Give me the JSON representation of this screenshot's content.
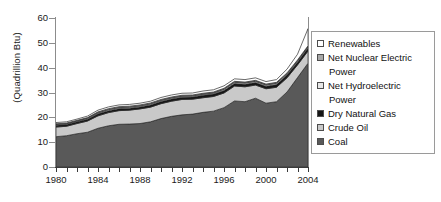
{
  "chart_data": {
    "type": "area",
    "stacked": true,
    "title": "",
    "xlabel": "",
    "ylabel": "(Quadrillion Btu)",
    "ylim": [
      0,
      60
    ],
    "ytick_values": [
      0,
      10,
      20,
      30,
      40,
      50,
      60
    ],
    "ytick_labels": [
      "0",
      "10",
      "20",
      "30",
      "40",
      "50",
      "60"
    ],
    "xlim": [
      1980,
      2004
    ],
    "x": [
      1980,
      1981,
      1982,
      1983,
      1984,
      1985,
      1986,
      1987,
      1988,
      1989,
      1990,
      1991,
      1992,
      1993,
      1994,
      1995,
      1996,
      1997,
      1998,
      1999,
      2000,
      2001,
      2002,
      2003,
      2004
    ],
    "xtick_values": [
      1980,
      1981,
      1982,
      1983,
      1984,
      1985,
      1986,
      1987,
      1988,
      1989,
      1990,
      1991,
      1992,
      1993,
      1994,
      1995,
      1996,
      1997,
      1998,
      1999,
      2000,
      2001,
      2002,
      2003,
      2004
    ],
    "xtick_labels": [
      {
        "value": 1980,
        "label": "1980"
      },
      {
        "value": 1984,
        "label": "1984"
      },
      {
        "value": 1988,
        "label": "1988"
      },
      {
        "value": 1992,
        "label": "1992"
      },
      {
        "value": 1996,
        "label": "1996"
      },
      {
        "value": 2000,
        "label": "2000"
      },
      {
        "value": 2004,
        "label": "2004"
      }
    ],
    "grid": false,
    "legend_position": "right",
    "series": [
      {
        "name": "Coal",
        "color": "#595959",
        "values": [
          12.2,
          12.6,
          13.4,
          14.0,
          15.6,
          16.6,
          17.2,
          17.3,
          17.5,
          18.2,
          19.5,
          20.4,
          21.0,
          21.3,
          22.0,
          22.5,
          23.9,
          26.6,
          26.3,
          27.7,
          25.7,
          26.3,
          30.2,
          36.0,
          41.8
        ],
        "swatch": "dark-gray"
      },
      {
        "name": "Crude Oil",
        "color": "#c9c9c9",
        "values": [
          3.9,
          3.8,
          4.1,
          4.5,
          5.0,
          5.3,
          5.5,
          5.6,
          5.9,
          5.9,
          6.0,
          6.1,
          6.2,
          6.0,
          5.9,
          5.9,
          5.9,
          6.0,
          6.0,
          5.3,
          5.8,
          5.8,
          5.7,
          5.1,
          4.9
        ],
        "swatch": "light-gray"
      },
      {
        "name": "Dry Natural Gas",
        "color": "#151515",
        "values": [
          0.7,
          0.7,
          0.7,
          0.7,
          0.8,
          0.8,
          0.8,
          0.8,
          0.8,
          0.9,
          0.9,
          0.9,
          0.9,
          0.9,
          1.0,
          1.0,
          1.0,
          1.0,
          1.0,
          1.0,
          1.0,
          1.1,
          1.1,
          1.1,
          1.2
        ],
        "swatch": "black"
      },
      {
        "name": "Net Hydroelectric Power",
        "color": "#e6e6e6",
        "values": [
          0.3,
          0.3,
          0.3,
          0.4,
          0.4,
          0.4,
          0.4,
          0.4,
          0.4,
          0.4,
          0.4,
          0.4,
          0.4,
          0.4,
          0.4,
          0.4,
          0.5,
          0.5,
          0.5,
          0.5,
          0.5,
          0.5,
          0.5,
          0.5,
          0.5
        ],
        "swatch": "very-light-gray"
      },
      {
        "name": "Net Nuclear Electric Power",
        "color": "#a8a8a8",
        "values": [
          0.3,
          0.3,
          0.3,
          0.3,
          0.4,
          0.4,
          0.4,
          0.4,
          0.4,
          0.4,
          0.4,
          0.4,
          0.4,
          0.4,
          0.4,
          0.4,
          0.4,
          0.4,
          0.4,
          0.4,
          0.4,
          0.4,
          0.4,
          0.4,
          0.4
        ],
        "swatch": "medium-gray"
      },
      {
        "name": "Renewables",
        "color": "#ffffff",
        "values": [
          0.5,
          0.5,
          0.5,
          0.6,
          0.7,
          0.7,
          0.7,
          0.7,
          0.7,
          0.7,
          0.8,
          0.8,
          0.8,
          0.8,
          0.9,
          0.9,
          1.0,
          1.0,
          1.0,
          1.0,
          1.0,
          1.1,
          1.5,
          2.3,
          6.9
        ],
        "swatch": "white"
      }
    ]
  },
  "legend": {
    "items": [
      {
        "label": "Renewables",
        "label2": "",
        "swatch": "white"
      },
      {
        "label": "Net Nuclear Electric",
        "label2": "Power",
        "swatch": "medium-gray"
      },
      {
        "label": "Net Hydroelectric",
        "label2": "Power",
        "swatch": "very-light-gray"
      },
      {
        "label": "Dry Natural Gas",
        "label2": "",
        "swatch": "black"
      },
      {
        "label": "Crude Oil",
        "label2": "",
        "swatch": "light-gray"
      },
      {
        "label": "Coal",
        "label2": "",
        "swatch": "dark-gray"
      }
    ]
  },
  "colors": {
    "white": "#ffffff",
    "very-light-gray": "#e6e6e6",
    "light-gray": "#c9c9c9",
    "medium-gray": "#a8a8a8",
    "dark-gray": "#595959",
    "black": "#151515",
    "axis": "#3a3a3a",
    "frame": "#8c8c8c",
    "text": "#111111"
  }
}
